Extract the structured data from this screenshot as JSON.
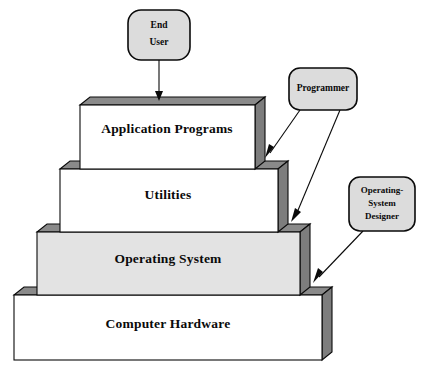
{
  "diagram": {
    "background_color": "#ffffff",
    "outline_color": "#0a0a0a",
    "colors": {
      "face_white": "#ffffff",
      "face_gray": "#e3e3e3",
      "top_dark": "#8a8a8a",
      "side_dark": "#7d7d7d",
      "actor_fill": "#dcdcdc",
      "stroke": "#0a0a0a"
    },
    "layers": [
      {
        "id": "application-programs",
        "label": "Application Programs",
        "fill": "#ffffff",
        "level": 1
      },
      {
        "id": "utilities",
        "label": "Utilities",
        "fill": "#ffffff",
        "level": 2
      },
      {
        "id": "operating-system",
        "label": "Operating System",
        "fill": "#e3e3e3",
        "level": 3
      },
      {
        "id": "computer-hardware",
        "label": "Computer Hardware",
        "fill": "#ffffff",
        "level": 4
      }
    ],
    "actors": [
      {
        "id": "end-user",
        "lines": [
          "End",
          "User"
        ],
        "targets": [
          "application-programs"
        ]
      },
      {
        "id": "programmer",
        "lines": [
          "Programmer"
        ],
        "targets": [
          "application-programs",
          "utilities"
        ]
      },
      {
        "id": "operating-system-designer",
        "lines": [
          "Operating-",
          "System",
          "Designer"
        ],
        "targets": [
          "operating-system"
        ]
      }
    ]
  }
}
